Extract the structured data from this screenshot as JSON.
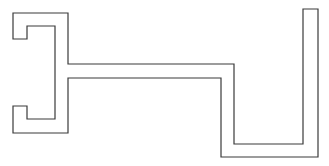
{
  "diagram": {
    "width": 329,
    "height": 166,
    "background": "#ffffff",
    "stroke_color": "#3a3a3a",
    "stroke_width": 1.2,
    "outline_points": "13,13 68,13 68,64 234,64 234,144 303,144 303,9 318,9 318,157 221,157 221,78 68,78 68,133 13,133 13,106 27,106 27,119 55,119 55,26 27,26 27,39 13,39"
  }
}
